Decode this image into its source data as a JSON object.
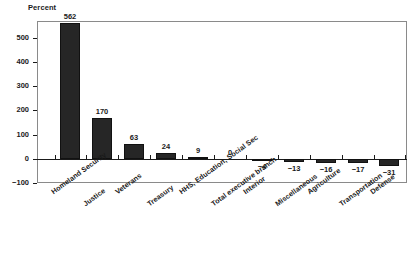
{
  "chart_data": {
    "type": "bar",
    "title": "",
    "subtitle": "",
    "xlabel": "",
    "ylabel": "Percent",
    "ylim": [
      -100,
      570
    ],
    "yticks": [
      -100,
      0,
      100,
      200,
      300,
      400,
      500
    ],
    "ytick_labels": [
      "−100",
      "0",
      "100",
      "200",
      "300",
      "400",
      "500"
    ],
    "grid": false,
    "legend": false,
    "bar_color": "#262626",
    "categories": [
      "Homeland Security",
      "Justice",
      "Veterans",
      "Treasury",
      "HHS, Education, Social Sec",
      "Total executive branch",
      "Interior",
      "Miscellaneous",
      "Agriculture",
      "Transportation",
      "Defense"
    ],
    "values": [
      562,
      170,
      63,
      24,
      9,
      0,
      -4,
      -13,
      -16,
      -17,
      -31
    ],
    "value_labels": [
      "562",
      "170",
      "63",
      "24",
      "9",
      "0",
      "−4",
      "−13",
      "−16",
      "−17",
      "−31"
    ]
  }
}
